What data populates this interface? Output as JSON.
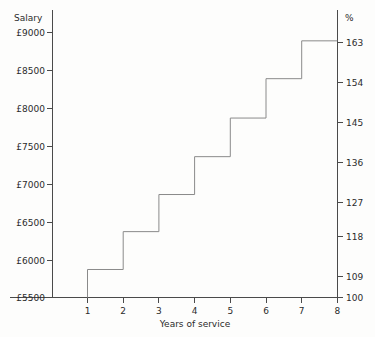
{
  "chart_data": {
    "type": "line",
    "title": "",
    "subtitle": "",
    "xlabel": "Years of service",
    "ylabel": "Salary",
    "y2label": "%",
    "grid": false,
    "legend": "none",
    "step_style": "post",
    "x": [
      1,
      2,
      3,
      4,
      5,
      6,
      7,
      8
    ],
    "categories": [
      "1",
      "2",
      "3",
      "4",
      "5",
      "6",
      "7",
      "8"
    ],
    "values": [
      5870,
      6370,
      6860,
      7360,
      7870,
      8390,
      8890,
      8890
    ],
    "percent_values": [
      109,
      118,
      127,
      136,
      145,
      154,
      163,
      163
    ],
    "series": [
      {
        "name": "Salary by years of service",
        "values": [
          5870,
          6370,
          6860,
          7360,
          7870,
          8390,
          8890,
          8890
        ]
      },
      {
        "name": "Percent of starting salary",
        "values": [
          109,
          118,
          127,
          136,
          145,
          154,
          163,
          163
        ]
      }
    ],
    "xlim": [
      0,
      8
    ],
    "ylim": [
      5500,
      9000
    ],
    "y2lim": [
      100,
      163
    ],
    "xticks": [
      1,
      2,
      3,
      4,
      5,
      6,
      7,
      8
    ],
    "xticklabels": [
      "1",
      "2",
      "3",
      "4",
      "5",
      "6",
      "7",
      "8"
    ],
    "yticks": [
      5500,
      6000,
      6500,
      7000,
      7500,
      8000,
      8500,
      9000
    ],
    "yticklabels": [
      "£5500",
      "£6000",
      "£6500",
      "£7000",
      "£7500",
      "£8000",
      "£8500",
      "£9000"
    ],
    "y2ticks": [
      100,
      109,
      118,
      127,
      136,
      145,
      154,
      163
    ],
    "y2ticklabels": [
      "100",
      "109",
      "118",
      "127",
      "136",
      "145",
      "154",
      "163"
    ],
    "colors": {
      "axis": "#4a4a4a",
      "step_line": "#8a8a8a",
      "text": "#2b2b2b",
      "background": "#fdfdfc"
    }
  }
}
